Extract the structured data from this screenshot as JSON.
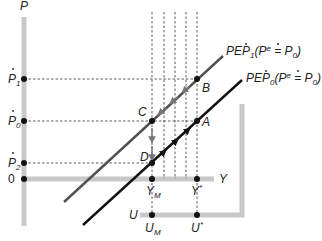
{
  "diagram": {
    "axes": {
      "vertical_label": "P",
      "horizontal_label": "Y",
      "origin_label": "0",
      "unemployment_label": "U"
    },
    "price_levels": [
      {
        "id": "P1",
        "base": "P",
        "sub": "1",
        "dot_over": true
      },
      {
        "id": "P0",
        "base": "P",
        "sub": "0",
        "dot_over": true
      },
      {
        "id": "P2",
        "base": "P",
        "sub": "2",
        "dot_over": true
      }
    ],
    "output_ticks": [
      {
        "id": "YM",
        "base": "Y",
        "sub": "M"
      },
      {
        "id": "Ystar",
        "base": "Y",
        "sup": "*"
      }
    ],
    "unemployment_ticks": [
      {
        "id": "UM",
        "base": "U",
        "sub": "M"
      },
      {
        "id": "Ustar",
        "base": "U",
        "sup": "*"
      }
    ],
    "points": [
      {
        "label": "A"
      },
      {
        "label": "B"
      },
      {
        "label": "C"
      },
      {
        "label": "D"
      }
    ],
    "curves": [
      {
        "name": "PEP",
        "sub": "1",
        "expectation": "(P",
        "eq": "e",
        "rhs": " = P",
        "rhs_sub": "0",
        "close": ")",
        "color": "#505050"
      },
      {
        "name": "PEP",
        "sub": "0",
        "expectation": "(P",
        "eq": "e",
        "rhs": " = P",
        "rhs_sub": "0",
        "close": ")",
        "color": "#111111"
      }
    ],
    "colors": {
      "axis_bar": "#c8c8c8",
      "pep1_line": "#505050",
      "pep0_line": "#111111",
      "arrow_gray": "#777777"
    }
  }
}
